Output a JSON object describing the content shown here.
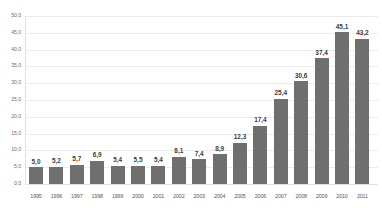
{
  "chart_data": {
    "type": "bar",
    "title": "",
    "subtitle": "",
    "xlabel": "",
    "ylabel": "",
    "grid": true,
    "legend": false,
    "legend_position": "none",
    "bar_color": "#6f6f6f",
    "grid_color": "#ececec",
    "ylim": [
      0,
      50
    ],
    "ytick_step": 5,
    "categories": [
      "1995",
      "1996",
      "1997",
      "1998",
      "1999",
      "2000",
      "2001",
      "2002",
      "2003",
      "2004",
      "2005",
      "2006",
      "2007",
      "2008",
      "2009",
      "2010",
      "2011"
    ],
    "values": [
      5.0,
      5.2,
      5.7,
      6.9,
      5.4,
      5.5,
      5.4,
      8.1,
      7.4,
      8.9,
      12.3,
      17.4,
      25.4,
      30.6,
      37.4,
      45.1,
      43.2
    ],
    "value_labels": [
      "5,0",
      "5,2",
      "5,7",
      "6,9",
      "5,4",
      "5,5",
      "5,4",
      "8,1",
      "7,4",
      "8,9",
      "12,3",
      "17,4",
      "25,4",
      "30,6",
      "37,4",
      "45,1",
      "43,2"
    ],
    "ytick_labels": [
      "0,0",
      "5,0",
      "10,0",
      "15,0",
      "20,0",
      "25,0",
      "30,0",
      "35,0",
      "40,0",
      "45,0",
      "50,0"
    ],
    "ytick_values": [
      0,
      5,
      10,
      15,
      20,
      25,
      30,
      35,
      40,
      45,
      50
    ]
  }
}
